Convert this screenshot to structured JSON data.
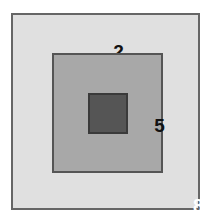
{
  "figure": {
    "name": "nested-squares-diagram",
    "background_color": "#ffffff",
    "squares": [
      {
        "id": "outer",
        "label": "2",
        "fill_color": "#e0e0e0",
        "border_color": "#666666",
        "label_color": "#121212"
      },
      {
        "id": "middle",
        "label": "5",
        "fill_color": "#a8a8a8",
        "border_color": "#555555",
        "label_color": "#121212"
      },
      {
        "id": "inner",
        "label": "8",
        "fill_color": "#555555",
        "border_color": "#3a3a3a",
        "label_color": "#ffffff"
      }
    ]
  },
  "chart_data": {
    "type": "table",
    "title": "",
    "categories": [
      "outer",
      "middle",
      "inner"
    ],
    "values": [
      2,
      5,
      8
    ],
    "xlabel": "",
    "ylabel": "",
    "annotations": [
      "2",
      "5",
      "8"
    ],
    "legend": []
  }
}
